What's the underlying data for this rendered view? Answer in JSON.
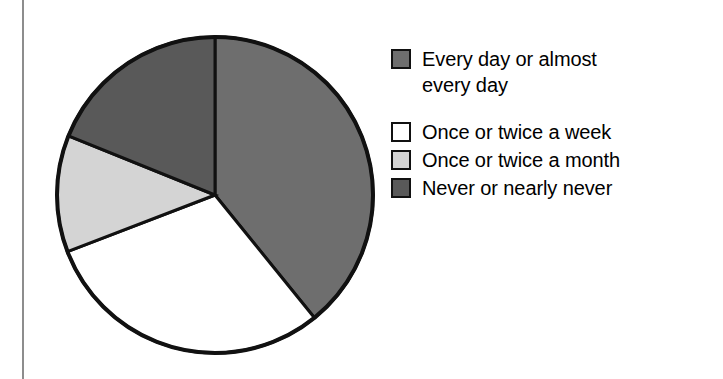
{
  "figure": {
    "background_color": "#ffffff",
    "divider_color": "#8d8d8d"
  },
  "chart_data": {
    "type": "pie",
    "title": "",
    "subtitle": "",
    "xlabel": "",
    "ylabel": "",
    "grid": false,
    "legend_position": "right",
    "start_angle_deg": 0,
    "direction": "clockwise",
    "categories": [
      "Every day or almost every day",
      "Once or twice a week",
      "Once or twice a month",
      "Never or nearly never"
    ],
    "values": [
      39,
      30,
      12,
      19
    ],
    "units": "percent",
    "angles_deg": [
      141,
      108,
      43,
      68
    ],
    "colors": [
      "#6e6e6e",
      "#ffffff",
      "#d4d4d4",
      "#595959"
    ],
    "slice_border_color": "#111111",
    "slices": [
      {
        "label": "Every day or almost every day",
        "value": 39,
        "angle_deg": 141,
        "start_deg": 0,
        "end_deg": 141,
        "color": "#6e6e6e"
      },
      {
        "label": "Once or twice a week",
        "value": 30,
        "angle_deg": 108,
        "start_deg": 141,
        "end_deg": 249,
        "color": "#ffffff"
      },
      {
        "label": "Once or twice a month",
        "value": 12,
        "angle_deg": 43,
        "start_deg": 249,
        "end_deg": 292,
        "color": "#d4d4d4"
      },
      {
        "label": "Never or nearly never",
        "value": 19,
        "angle_deg": 68,
        "start_deg": 292,
        "end_deg": 360,
        "color": "#595959"
      }
    ]
  },
  "legend": {
    "items": [
      {
        "label": "Every day or almost\nevery day",
        "color": "#6e6e6e"
      },
      {
        "label": "Once or twice a week",
        "color": "#ffffff"
      },
      {
        "label": "Once or twice a month",
        "color": "#d4d4d4"
      },
      {
        "label": "Never or nearly never",
        "color": "#595959"
      }
    ]
  }
}
